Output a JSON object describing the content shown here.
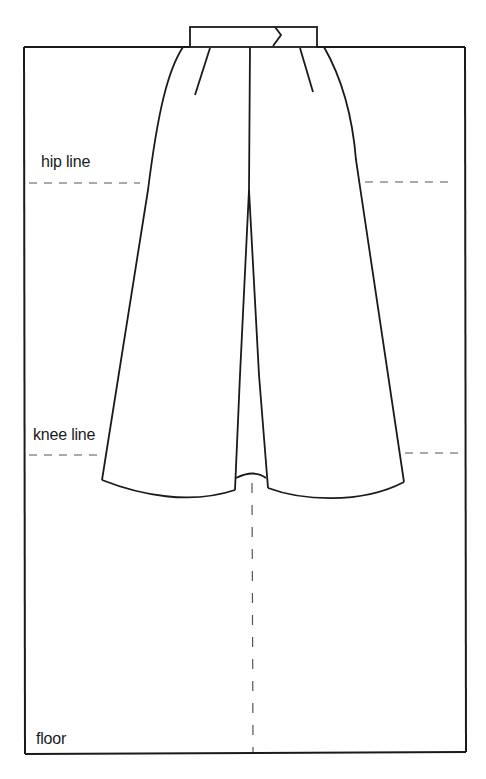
{
  "diagram": {
    "labels": {
      "hip": "hip line",
      "knee": "knee line",
      "floor": "floor"
    },
    "colors": {
      "ink": "#1a1a1a",
      "dash": "#555555",
      "background": "#ffffff"
    }
  }
}
